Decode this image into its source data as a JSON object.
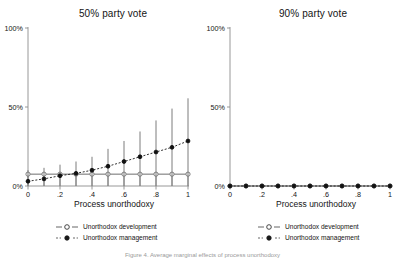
{
  "figure": {
    "footnote": "Figure 4. Average marginal effects of process unorthodoxy"
  },
  "legend": {
    "items": [
      {
        "label": "Unorthodox development",
        "marker": "open-circle-icon",
        "line": "solid",
        "color": "#6e6e6e"
      },
      {
        "label": "Unorthodox management",
        "marker": "filled-circle-icon",
        "line": "dashed",
        "color": "#1a1a1a"
      }
    ]
  },
  "axes": {
    "xlabel": "Process unorthodoxy",
    "ylabel": "",
    "xticks": [
      "0",
      ".2",
      ".4",
      ".6",
      ".8",
      "1"
    ],
    "yticks": [
      "0%",
      "50%",
      "100%"
    ]
  },
  "chart_data": [
    {
      "type": "line",
      "title": "50% party vote",
      "xlabel": "Process unorthodoxy",
      "ylabel": "",
      "xlim": [
        0,
        1
      ],
      "ylim": [
        0,
        1
      ],
      "xticks": [
        0,
        0.2,
        0.4,
        0.6,
        0.8,
        1
      ],
      "xticklabels": [
        "0",
        ".2",
        ".4",
        ".6",
        ".8",
        "1"
      ],
      "yticks": [
        0,
        0.5,
        1
      ],
      "yticklabels": [
        "0%",
        "50%",
        "100%"
      ],
      "grid": false,
      "legend_position": "below",
      "x": [
        0,
        0.1,
        0.2,
        0.3,
        0.4,
        0.5,
        0.6,
        0.7,
        0.8,
        0.9,
        1.0
      ],
      "series": [
        {
          "name": "Unorthodox development",
          "marker": "open-circle",
          "linestyle": "solid",
          "color": "#6e6e6e",
          "values": [
            0.075,
            0.075,
            0.075,
            0.075,
            0.075,
            0.075,
            0.075,
            0.075,
            0.075,
            0.075,
            0.075
          ],
          "ci_lower": [
            0.0,
            0.0,
            0.0,
            0.0,
            0.0,
            0.0,
            0.0,
            0.0,
            0.0,
            0.0,
            0.0
          ],
          "ci_upper": [
            0.075,
            0.075,
            0.075,
            0.075,
            0.075,
            0.075,
            0.075,
            0.075,
            0.075,
            0.075,
            0.075
          ]
        },
        {
          "name": "Unorthodox management",
          "marker": "filled-circle",
          "linestyle": "dashed",
          "color": "#1a1a1a",
          "values": [
            0.03,
            0.045,
            0.065,
            0.08,
            0.1,
            0.125,
            0.155,
            0.185,
            0.215,
            0.245,
            0.285
          ],
          "ci_lower": [
            0.0,
            0.0,
            0.0,
            0.0,
            0.0,
            0.0,
            0.0,
            0.0,
            0.0,
            0.0,
            0.0
          ],
          "ci_upper": [
            0.1,
            0.115,
            0.135,
            0.155,
            0.185,
            0.235,
            0.285,
            0.345,
            0.415,
            0.49,
            0.555
          ]
        }
      ]
    },
    {
      "type": "line",
      "title": "90% party vote",
      "xlabel": "Process unorthodoxy",
      "ylabel": "",
      "xlim": [
        0,
        1
      ],
      "ylim": [
        0,
        1
      ],
      "xticks": [
        0,
        0.2,
        0.4,
        0.6,
        0.8,
        1
      ],
      "xticklabels": [
        "0",
        ".2",
        ".4",
        ".6",
        ".8",
        "1"
      ],
      "yticks": [
        0,
        0.5,
        1
      ],
      "yticklabels": [
        "0%",
        "50%",
        "100%"
      ],
      "grid": false,
      "legend_position": "below",
      "x": [
        0,
        0.1,
        0.2,
        0.3,
        0.4,
        0.5,
        0.6,
        0.7,
        0.8,
        0.9,
        1.0
      ],
      "series": [
        {
          "name": "Unorthodox development",
          "marker": "open-circle",
          "linestyle": "solid",
          "color": "#6e6e6e",
          "values": [
            0,
            0,
            0,
            0,
            0,
            0,
            0,
            0,
            0,
            0,
            0
          ],
          "ci_lower": [
            0,
            0,
            0,
            0,
            0,
            0,
            0,
            0,
            0,
            0,
            0
          ],
          "ci_upper": [
            0,
            0,
            0,
            0,
            0,
            0,
            0,
            0,
            0,
            0,
            0
          ]
        },
        {
          "name": "Unorthodox management",
          "marker": "filled-circle",
          "linestyle": "dashed",
          "color": "#1a1a1a",
          "values": [
            0,
            0,
            0,
            0,
            0,
            0,
            0,
            0,
            0,
            0,
            0
          ],
          "ci_lower": [
            0,
            0,
            0,
            0,
            0,
            0,
            0,
            0,
            0,
            0,
            0
          ],
          "ci_upper": [
            0,
            0,
            0,
            0,
            0,
            0,
            0,
            0,
            0,
            0,
            0
          ]
        }
      ]
    }
  ]
}
